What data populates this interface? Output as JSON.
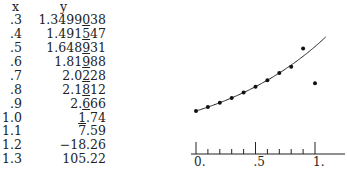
{
  "table": {
    "headers": {
      "x": "x",
      "y": "y"
    },
    "rows": [
      {
        "x": ".3",
        "y_pre": "1.3499",
        "y_u": "0",
        "y_post": "38"
      },
      {
        "x": ".4",
        "y_pre": "1.491",
        "y_u": "5",
        "y_post": "47"
      },
      {
        "x": ".5",
        "y_pre": "1.648",
        "y_u": "9",
        "y_post": "31"
      },
      {
        "x": ".6",
        "y_pre": "1.81",
        "y_u": "9",
        "y_post": "88"
      },
      {
        "x": ".7",
        "y_pre": "2.0",
        "y_u": "2",
        "y_post": "28"
      },
      {
        "x": ".8",
        "y_pre": "2.1",
        "y_u": "8",
        "y_post": "12"
      },
      {
        "x": ".9",
        "y_pre": "2.",
        "y_u": "6",
        "y_post": "66"
      },
      {
        "x": "1.0",
        "y_pre": "",
        "y_u": "1",
        "y_post": ".74"
      },
      {
        "x": "1.1",
        "y_pre": "7.59",
        "y_u": "",
        "y_post": ""
      },
      {
        "x": "1.2",
        "y_pre": "−18.26",
        "y_u": "",
        "y_post": ""
      },
      {
        "x": "1.3",
        "y_pre": "105.22",
        "y_u": "",
        "y_post": ""
      }
    ]
  },
  "chart_data": {
    "type": "scatter",
    "title": "",
    "xlabel": "",
    "ylabel": "",
    "x_ticks": [
      "0.",
      ".5",
      "1."
    ],
    "xlim": [
      0,
      1.05
    ],
    "grid": false,
    "series": [
      {
        "name": "computed points",
        "style": "dots",
        "x": [
          0,
          0.1,
          0.2,
          0.3,
          0.4,
          0.5,
          0.6,
          0.7,
          0.8,
          0.9,
          1.0
        ],
        "y": [
          1.0,
          1.105,
          1.221,
          1.35,
          1.492,
          1.649,
          1.822,
          2.014,
          2.18,
          2.67,
          1.74
        ]
      },
      {
        "name": "exact curve e^x",
        "style": "line",
        "x": [
          0,
          0.1,
          0.2,
          0.3,
          0.4,
          0.5,
          0.6,
          0.7,
          0.8,
          0.9,
          1.0,
          1.05
        ],
        "y": [
          1.0,
          1.105,
          1.221,
          1.35,
          1.492,
          1.649,
          1.822,
          2.014,
          2.226,
          2.46,
          2.718,
          2.858
        ]
      }
    ]
  }
}
